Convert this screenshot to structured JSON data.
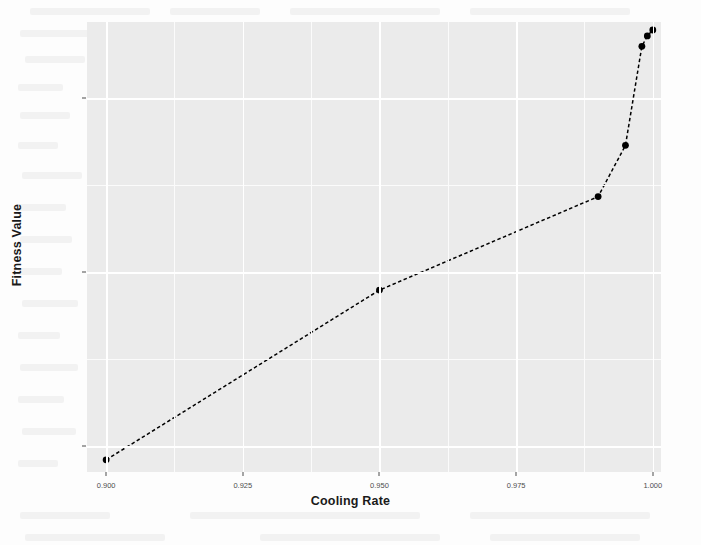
{
  "figure": {
    "x_axis_title": "Cooling Rate",
    "y_axis_title": "Fitness Value",
    "panel_background": "#ebebeb",
    "grid_color": "#ffffff",
    "point_color": "#000000",
    "line_color": "#000000"
  },
  "chart_data": {
    "type": "line",
    "title": "",
    "subtitle": "",
    "xlabel": "Cooling Rate",
    "ylabel": "Fitness Value",
    "xlim": [
      0.8965,
      1.0015
    ],
    "ylim": [
      -31500,
      -5600
    ],
    "xticks": [
      0.9,
      0.925,
      0.95,
      0.975,
      1.0
    ],
    "xtick_labels": [
      "0.900",
      "0.925",
      "0.950",
      "0.975",
      "1.000"
    ],
    "yticks": [
      -10000,
      -20000,
      -30000
    ],
    "ytick_labels": [
      "-10000",
      "-20000",
      "-30000"
    ],
    "grid": true,
    "legend": null,
    "line_style": "dashed",
    "marker": "circle",
    "series": [
      {
        "name": "Fitness Value",
        "x": [
          0.9,
          0.95,
          0.99,
          0.995,
          0.998,
          0.999,
          1.0
        ],
        "y": [
          -30800,
          -21030,
          -15650,
          -12700,
          -7000,
          -6400,
          -6060
        ]
      }
    ],
    "points": [
      {
        "x": 0.9,
        "y": -30800
      },
      {
        "x": 0.95,
        "y": -21030
      },
      {
        "x": 0.99,
        "y": -15650
      },
      {
        "x": 0.995,
        "y": -12700
      },
      {
        "x": 0.998,
        "y": -7000
      },
      {
        "x": 0.999,
        "y": -6400
      },
      {
        "x": 1.0,
        "y": -6060
      }
    ]
  },
  "xtick_labels": [
    "0.900",
    "0.925",
    "0.950",
    "0.975",
    "1.000"
  ],
  "ytick_labels": [
    "-10000",
    "-20000",
    "-30000"
  ]
}
